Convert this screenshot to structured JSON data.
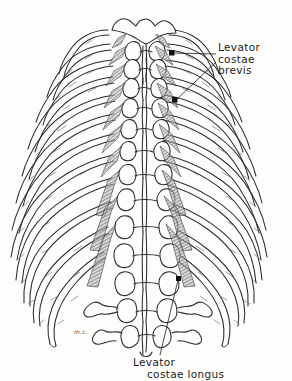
{
  "figure": {
    "kind": "anatomical-line-drawing",
    "background_color": "#fdfdfc",
    "ink_color": "#2b2b2b",
    "muscle_fill_color": "#8a8a8a",
    "artist_signature": "m.c."
  },
  "labels": {
    "brevis": {
      "line1": "Levator",
      "line2": "costae",
      "line3": "brevis"
    },
    "longus": {
      "line1": "Levator",
      "line2": "costae longus"
    }
  },
  "leaders": {
    "brevis_upper_marker": "dot-marker",
    "brevis_lower_marker": "dot-marker",
    "longus_marker": "dot-marker"
  },
  "anatomy": {
    "rib_pairs": 12,
    "vertebrae_visible": 15,
    "levator_brevis_count": 14,
    "levator_longus_count": 6
  }
}
